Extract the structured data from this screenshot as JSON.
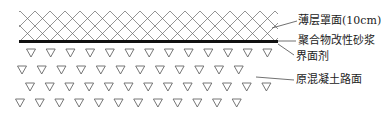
{
  "diagram": {
    "title": "",
    "layers": [
      {
        "id": "overlay",
        "label": "薄层罩面(10cm)",
        "pattern": "crosshatch"
      },
      {
        "id": "mortar",
        "label": "聚合物改性砂浆",
        "pattern": "thick-line"
      },
      {
        "id": "interface",
        "label": "界面剂",
        "pattern": "line"
      },
      {
        "id": "concrete",
        "label": "原混凝土路面",
        "pattern": "triangles"
      }
    ],
    "colors": {
      "line": "#555555",
      "mortar": "#111111",
      "triangle": "#666666",
      "text": "#222222"
    }
  }
}
